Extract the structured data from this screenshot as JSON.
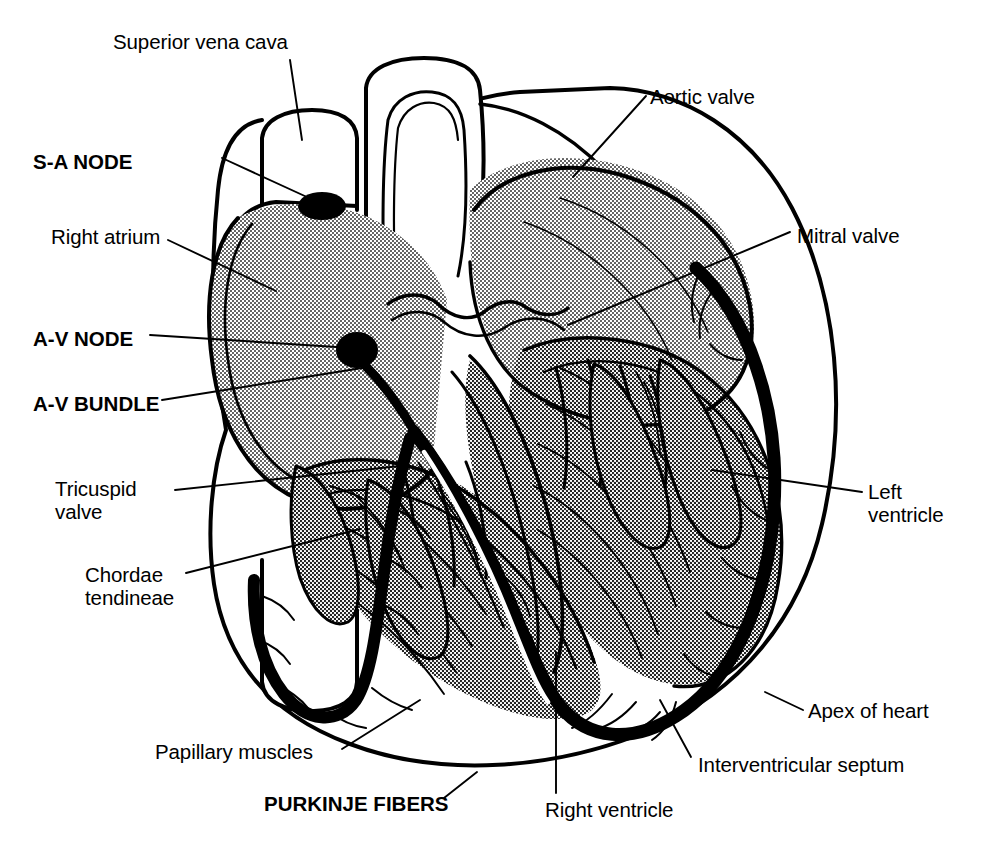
{
  "figure": {
    "background_color": "#ffffff",
    "ink_color": "#000000",
    "myocardium_fill": "#b8b8b8",
    "width": 989,
    "height": 855
  },
  "labels": [
    {
      "id": "superior-vena-cava",
      "text": "Superior vena cava",
      "bold": false,
      "x": 113,
      "y": 30,
      "align": "left"
    },
    {
      "id": "sa-node",
      "text": "S-A NODE",
      "bold": true,
      "x": 33,
      "y": 150,
      "align": "left"
    },
    {
      "id": "right-atrium",
      "text": "Right atrium",
      "bold": false,
      "x": 51,
      "y": 225,
      "align": "left"
    },
    {
      "id": "av-node",
      "text": "A-V NODE",
      "bold": true,
      "x": 33,
      "y": 327,
      "align": "left"
    },
    {
      "id": "av-bundle",
      "text": "A-V BUNDLE",
      "bold": true,
      "x": 33,
      "y": 392,
      "align": "left"
    },
    {
      "id": "tricuspid-valve",
      "text": "Tricuspid\nvalve",
      "bold": false,
      "x": 55,
      "y": 477,
      "align": "left"
    },
    {
      "id": "chordae-tendineae",
      "text": "Chordae\ntendineae",
      "bold": false,
      "x": 85,
      "y": 563,
      "align": "left"
    },
    {
      "id": "papillary-muscles",
      "text": "Papillary muscles",
      "bold": false,
      "x": 155,
      "y": 740,
      "align": "left"
    },
    {
      "id": "purkinje-fibers",
      "text": "PURKINJE FIBERS",
      "bold": true,
      "x": 264,
      "y": 792,
      "align": "left"
    },
    {
      "id": "right-ventricle",
      "text": "Right ventricle",
      "bold": false,
      "x": 545,
      "y": 798,
      "align": "left"
    },
    {
      "id": "interventricular-septum",
      "text": "Interventricular septum",
      "bold": false,
      "x": 698,
      "y": 753,
      "align": "left"
    },
    {
      "id": "apex-of-heart",
      "text": "Apex of heart",
      "bold": false,
      "x": 808,
      "y": 699,
      "align": "left"
    },
    {
      "id": "left-ventricle",
      "text": "Left\nventricle",
      "bold": false,
      "x": 868,
      "y": 480,
      "align": "left"
    },
    {
      "id": "mitral-valve",
      "text": "Mitral valve",
      "bold": false,
      "x": 797,
      "y": 224,
      "align": "left"
    },
    {
      "id": "aortic-valve",
      "text": "Aortic valve",
      "bold": false,
      "x": 650,
      "y": 85,
      "align": "left"
    }
  ],
  "leader_lines": [
    {
      "id": "leader-superior-vena-cava",
      "points": "290,60 302,140"
    },
    {
      "id": "leader-sa-node",
      "points": "222,158 320,203"
    },
    {
      "id": "leader-right-atrium",
      "points": "168,240 276,291"
    },
    {
      "id": "leader-av-node",
      "points": "150,335 352,348"
    },
    {
      "id": "leader-av-bundle",
      "points": "162,400 362,368"
    },
    {
      "id": "leader-tricuspid-valve",
      "points": "175,490 400,466"
    },
    {
      "id": "leader-chordae-tendineae",
      "points": "186,573 360,529"
    },
    {
      "id": "leader-papillary-muscles",
      "points": "342,749 420,700"
    },
    {
      "id": "leader-purkinje-fibers",
      "points": "444,798 477,772"
    },
    {
      "id": "leader-right-ventricle",
      "points": "556,793 556,652"
    },
    {
      "id": "leader-interventricular-septum",
      "points": "691,757 660,700"
    },
    {
      "id": "leader-apex-of-heart",
      "points": "803,710 765,692"
    },
    {
      "id": "leader-left-ventricle",
      "points": "862,492 712,470"
    },
    {
      "id": "leader-mitral-valve",
      "points": "790,232 568,325"
    },
    {
      "id": "leader-aortic-valve",
      "points": "646,96 573,177"
    }
  ],
  "structures": [
    {
      "id": "superior-vena-cava-vessel",
      "name": "Superior vena cava"
    },
    {
      "id": "aorta-vessel",
      "name": "Aorta"
    },
    {
      "id": "inferior-vena-cava-vessel",
      "name": "Inferior vena cava"
    },
    {
      "id": "right-atrium-chamber",
      "name": "Right atrium"
    },
    {
      "id": "left-atrium-chamber",
      "name": "Left atrium"
    },
    {
      "id": "right-ventricle-chamber",
      "name": "Right ventricle"
    },
    {
      "id": "left-ventricle-chamber",
      "name": "Left ventricle"
    },
    {
      "id": "interventricular-septum-wall",
      "name": "Interventricular septum"
    },
    {
      "id": "sa-node-marker",
      "name": "Sinoatrial node"
    },
    {
      "id": "av-node-marker",
      "name": "Atrioventricular node"
    },
    {
      "id": "av-bundle-path",
      "name": "Atrioventricular bundle (bundle of His)"
    },
    {
      "id": "purkinje-network",
      "name": "Purkinje fiber network"
    },
    {
      "id": "aortic-valve-cusps",
      "name": "Aortic valve"
    },
    {
      "id": "mitral-valve-leaflets",
      "name": "Mitral valve"
    },
    {
      "id": "tricuspid-valve-leaflets",
      "name": "Tricuspid valve"
    },
    {
      "id": "papillary-muscle-group",
      "name": "Papillary muscles"
    },
    {
      "id": "chordae-tendineae-strands",
      "name": "Chordae tendineae"
    },
    {
      "id": "apex",
      "name": "Apex of heart"
    }
  ]
}
